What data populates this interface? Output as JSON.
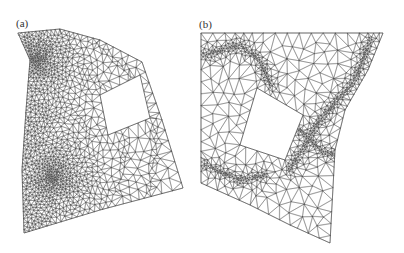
{
  "figure": {
    "panels": [
      {
        "id": "a",
        "label": "(a)",
        "description": "Curved quadrilateral domain with rectangular hole; triangular mesh refined around two point sources and along concentric arc bands",
        "outline": [
          [
            18,
            33
          ],
          [
            60,
            29
          ],
          [
            100,
            40
          ],
          [
            142,
            62
          ],
          [
            162,
            120
          ],
          [
            183,
            188
          ],
          [
            100,
            210
          ],
          [
            24,
            233
          ],
          [
            22,
            170
          ],
          [
            26,
            110
          ],
          [
            30,
            60
          ]
        ],
        "hole": [
          [
            100,
            95
          ],
          [
            140,
            75
          ],
          [
            150,
            118
          ],
          [
            108,
            135
          ]
        ],
        "refinement_points": [
          [
            37,
            59
          ],
          [
            53,
            177
          ]
        ],
        "arc_center": [
          30,
          150
        ],
        "arc_radii": [
          60,
          95,
          125
        ]
      },
      {
        "id": "b",
        "label": "(b)",
        "description": "Curved domain with rotated square hole; triangular mesh refined along curved bands",
        "outline": [
          [
            201,
            33
          ],
          [
            383,
            33
          ],
          [
            368,
            70
          ],
          [
            345,
            110
          ],
          [
            335,
            150
          ],
          [
            330,
            243
          ],
          [
            290,
            225
          ],
          [
            250,
            205
          ],
          [
            201,
            183
          ]
        ],
        "hole": [
          [
            257,
            88
          ],
          [
            303,
            115
          ],
          [
            285,
            160
          ],
          [
            240,
            145
          ]
        ],
        "bands": [
          [
            [
              205,
              55
            ],
            [
              240,
              45
            ],
            [
              260,
              60
            ],
            [
              270,
              85
            ]
          ],
          [
            [
              370,
              40
            ],
            [
              355,
              80
            ],
            [
              320,
              120
            ],
            [
              290,
              170
            ]
          ],
          [
            [
              205,
              165
            ],
            [
              240,
              180
            ],
            [
              265,
              175
            ]
          ],
          [
            [
              300,
              130
            ],
            [
              320,
              150
            ],
            [
              335,
              155
            ]
          ]
        ]
      }
    ]
  },
  "colors": {
    "background": "#ffffff",
    "mesh_edge": "#4a4a4a",
    "label_text": "#333333"
  }
}
